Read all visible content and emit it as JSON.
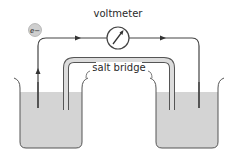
{
  "diagram": {
    "labels": {
      "voltmeter": "voltmeter",
      "salt_bridge": "salt bridge",
      "electron": "e−"
    },
    "colors": {
      "wire": "#444444",
      "solution": "#d4d4d4",
      "beaker_outline": "#555555",
      "electron_fill": "#cfcfcf",
      "salt_bridge_fill": "#dcdcdc"
    },
    "components": [
      {
        "id": "left-beaker",
        "type": "beaker",
        "contains": "solution"
      },
      {
        "id": "right-beaker",
        "type": "beaker",
        "contains": "solution"
      },
      {
        "id": "left-electrode",
        "type": "electrode"
      },
      {
        "id": "right-electrode",
        "type": "electrode"
      },
      {
        "id": "voltmeter",
        "type": "meter"
      },
      {
        "id": "salt-bridge",
        "type": "tube"
      },
      {
        "id": "electron",
        "type": "particle",
        "label": "e−"
      }
    ],
    "flow": "electrons flow from left electrode through voltmeter to right electrode"
  }
}
